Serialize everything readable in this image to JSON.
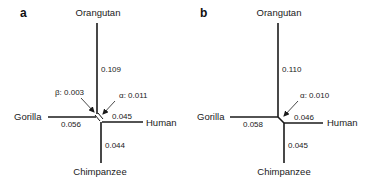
{
  "panels": [
    {
      "id": "a",
      "label": "a",
      "taxa": {
        "orangutan": "Orangutan",
        "gorilla": "Gorilla",
        "human": "Human",
        "chimpanzee": "Chimpanzee"
      },
      "branch_lengths": {
        "orangutan": "0.109",
        "gorilla": "0.056",
        "human": "0.045",
        "chimpanzee": "0.044"
      },
      "internal_branches": {
        "beta": "β: 0.003",
        "alpha": "α: 0.011"
      }
    },
    {
      "id": "b",
      "label": "b",
      "taxa": {
        "orangutan": "Orangutan",
        "gorilla": "Gorilla",
        "human": "Human",
        "chimpanzee": "Chimpanzee"
      },
      "branch_lengths": {
        "orangutan": "0.110",
        "gorilla": "0.058",
        "human": "0.046",
        "chimpanzee": "0.045"
      },
      "internal_branches": {
        "alpha": "α: 0.010"
      }
    }
  ]
}
